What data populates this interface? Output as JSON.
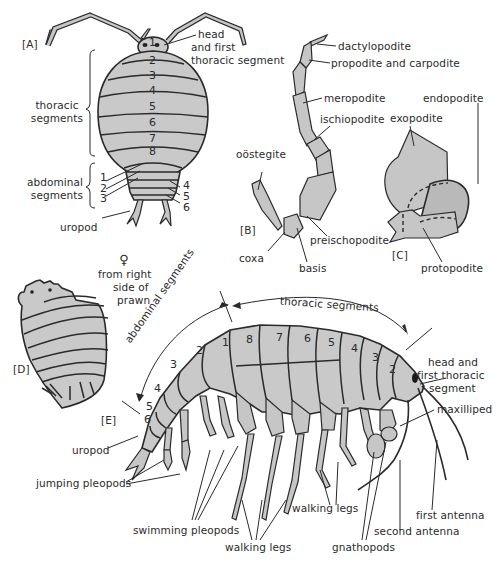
{
  "panels": {
    "A": {
      "tag": "[A]",
      "labels": {
        "head": "head",
        "head2": "and first",
        "head3": "thoracic segment",
        "thoracic1": "thoracic",
        "thoracic2": "segments",
        "abdominal1": "abdominal",
        "abdominal2": "segments",
        "uropod": "uropod"
      },
      "thoracic_numbers": [
        "2",
        "3",
        "4",
        "5",
        "6",
        "7",
        "8"
      ],
      "head_number": "1",
      "abdominal_numbers": [
        "1",
        "2",
        "3",
        "4",
        "5",
        "6"
      ]
    },
    "B": {
      "tag": "[B]",
      "labels": {
        "dactylopodite": "dactylopodite",
        "propodite": "propodite and carpodite",
        "meropodite": "meropodite",
        "ischiopodite": "ischiopodite",
        "oostegite": "oöstegite",
        "preischopodite": "preischopodite",
        "coxa": "coxa",
        "basis": "basis"
      }
    },
    "C": {
      "tag": "[C]",
      "labels": {
        "endopodite": "endopodite",
        "exopodite": "exopodite",
        "protopodite": "protopodite"
      }
    },
    "D": {
      "tag": "[D]",
      "symbol": "♀",
      "caption1": "from right",
      "caption2": "side of",
      "caption3": "prawn"
    },
    "E": {
      "tag": "[E]",
      "labels": {
        "abdominal_segments": "abdominal segments",
        "thoracic_segments": "thoracic segments",
        "head1": "head and",
        "head2": "first thoracic",
        "head3": "segment",
        "maxilliped": "maxilliped",
        "uropod": "uropod",
        "jumping": "jumping pleopods",
        "swimming": "swimming pleopods",
        "walking_a": "walking legs",
        "walking_b": "walking legs",
        "gnathopods": "gnathopods",
        "second_antenna": "second antenna",
        "first_antenna": "first antenna"
      },
      "thoracic_numbers": [
        "8",
        "7",
        "6",
        "5",
        "4",
        "3",
        "2"
      ],
      "abdominal_numbers": [
        "1",
        "2",
        "3",
        "4",
        "5",
        "6"
      ]
    }
  },
  "colors": {
    "body_fill": "#c9c9c9",
    "outline": "#2a2a2a",
    "background": "#ffffff"
  }
}
